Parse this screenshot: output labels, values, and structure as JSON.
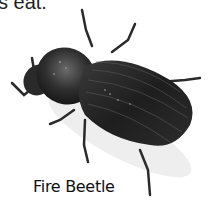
{
  "page": {
    "top_text_fragment": "s eat.",
    "caption": "Fire Beetle"
  },
  "illustration": {
    "subject": "beetle-illustration",
    "colors": {
      "body_dark": "#1c1c1c",
      "body_mid": "#3a3a3a",
      "highlight": "#8a8a8a",
      "legs": "#2a2a2a",
      "shadow": "#e6e6e6"
    }
  }
}
